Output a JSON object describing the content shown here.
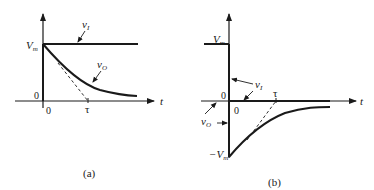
{
  "panels": [
    {
      "id": "a",
      "caption": "(a)",
      "y_level_label": "V",
      "y_level_sub": "m",
      "origin_y_label": "0",
      "origin_x_label": "0",
      "tau_label": "τ",
      "t_label": "t",
      "input_label": "v",
      "input_sub": "I",
      "output_label": "v",
      "output_sub": "O"
    },
    {
      "id": "b",
      "caption": "(b)",
      "y_level_label": "V",
      "y_level_sub": "m",
      "neg_level_label": "−V",
      "neg_level_sub": "m",
      "origin_y_label": "0",
      "origin_x_label": "0",
      "tau_label": "τ",
      "t_label": "t",
      "input_label": "v",
      "input_sub": "I",
      "output_label": "v",
      "output_sub": "O"
    }
  ],
  "colors": {
    "ink": "#1a1a1a",
    "background": "#ffffff"
  }
}
